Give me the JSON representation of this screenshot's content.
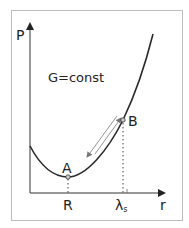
{
  "diagram": {
    "annotation": "G=const",
    "axes": {
      "y_label": "P",
      "x_label": "r"
    },
    "points": {
      "A": {
        "label": "A",
        "x_tick_label": "R"
      },
      "B": {
        "label": "B",
        "x_tick_label": "λ",
        "x_tick_subscript": "s"
      }
    },
    "colors": {
      "curve": "#2a2a2a",
      "axes": "#333333",
      "frame": "#bdbdbd",
      "dotted": "#444444",
      "arrows": "#777777",
      "point_marker_fill": "#cccccc"
    }
  }
}
